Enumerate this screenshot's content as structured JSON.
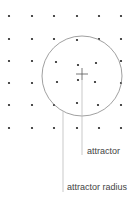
{
  "diagram": {
    "colors": {
      "background": "#ffffff",
      "dot": "#222222",
      "circle": "#888888",
      "leader": "#bbbbbb",
      "crosshair": "#555555",
      "text": "#444444"
    },
    "points": [
      {
        "x": 9,
        "y": 16
      },
      {
        "x": 32,
        "y": 16
      },
      {
        "x": 54,
        "y": 16
      },
      {
        "x": 77,
        "y": 16
      },
      {
        "x": 99,
        "y": 16
      },
      {
        "x": 121,
        "y": 16
      },
      {
        "x": 9,
        "y": 39
      },
      {
        "x": 32,
        "y": 39
      },
      {
        "x": 54,
        "y": 39
      },
      {
        "x": 77,
        "y": 40
      },
      {
        "x": 99,
        "y": 39
      },
      {
        "x": 121,
        "y": 39
      },
      {
        "x": 9,
        "y": 61
      },
      {
        "x": 32,
        "y": 61
      },
      {
        "x": 56,
        "y": 62
      },
      {
        "x": 78,
        "y": 65
      },
      {
        "x": 96,
        "y": 63
      },
      {
        "x": 121,
        "y": 61
      },
      {
        "x": 9,
        "y": 83
      },
      {
        "x": 32,
        "y": 83
      },
      {
        "x": 57,
        "y": 82
      },
      {
        "x": 78,
        "y": 80
      },
      {
        "x": 95,
        "y": 82
      },
      {
        "x": 121,
        "y": 83
      },
      {
        "x": 9,
        "y": 105
      },
      {
        "x": 32,
        "y": 105
      },
      {
        "x": 54,
        "y": 105
      },
      {
        "x": 77,
        "y": 103
      },
      {
        "x": 98,
        "y": 105
      },
      {
        "x": 121,
        "y": 105
      },
      {
        "x": 9,
        "y": 128
      },
      {
        "x": 32,
        "y": 128
      },
      {
        "x": 54,
        "y": 128
      },
      {
        "x": 77,
        "y": 128
      },
      {
        "x": 99,
        "y": 128
      },
      {
        "x": 121,
        "y": 128
      }
    ],
    "attractor": {
      "cx": 82,
      "cy": 76,
      "r": 40
    },
    "labels": {
      "attractor": "attractor",
      "attractor_radius": "attractor radius"
    }
  }
}
